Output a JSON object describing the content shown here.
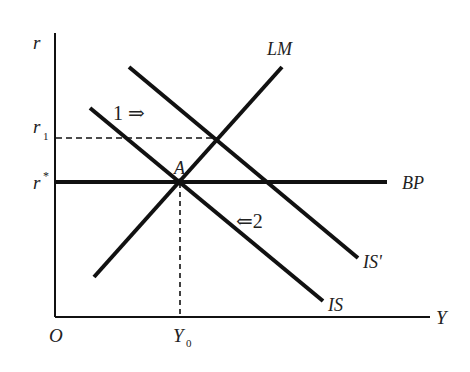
{
  "diagram": {
    "colors": {
      "line": "#111111",
      "text": "#222222",
      "background": "#ffffff"
    },
    "axes": {
      "y_label": "r",
      "x_label": "Y",
      "origin_label": "O"
    },
    "ticks": {
      "r1": {
        "base": "r",
        "sub": "1"
      },
      "rstar": {
        "base": "r",
        "sup": "*"
      },
      "y0": {
        "base": "Y",
        "sub": "0"
      }
    },
    "curves": [
      {
        "id": "LM",
        "label": "LM"
      },
      {
        "id": "IS",
        "label": "IS"
      },
      {
        "id": "IS_prime",
        "label": "IS'"
      },
      {
        "id": "BP",
        "label": "BP"
      }
    ],
    "point_label": "A",
    "annotations": [
      {
        "id": "shift1",
        "text": "1 ⇒"
      },
      {
        "id": "shift2",
        "text": "⇐2"
      }
    ]
  }
}
